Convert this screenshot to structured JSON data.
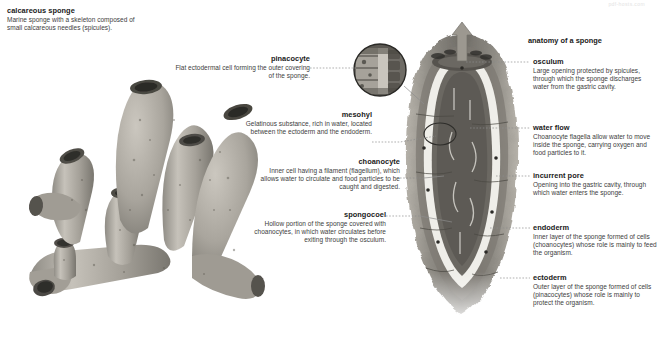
{
  "watermark": "pdf-hosts.com",
  "left_panel": {
    "title": "calcareous sponge",
    "description": "Marine sponge with a skeleton composed of small calcareous needles (spicules)."
  },
  "right_panel": {
    "section_title": "anatomy of a sponge"
  },
  "labels_left": [
    {
      "id": "pinacocyte",
      "title": "pinacocyte",
      "description": "Flat ectodermal cell forming the outer covering of the sponge."
    },
    {
      "id": "mesohyl",
      "title": "mesohyl",
      "description": "Gelatinous substance, rich in water, located between the ectoderm and the endoderm."
    },
    {
      "id": "choanocyte",
      "title": "choanocyte",
      "description": "Inner cell having a filament (flagellum), which allows water to circulate and food particles to be caught and digested."
    },
    {
      "id": "spongocoel",
      "title": "spongocoel",
      "description": "Hollow portion of the sponge covered with choanocytes, in which water circulates before exiting through the osculum."
    }
  ],
  "labels_right": [
    {
      "id": "osculum",
      "title": "osculum",
      "description": "Large opening protected by spicules, through which the sponge discharges water from the gastric cavity."
    },
    {
      "id": "water-flow",
      "title": "water flow",
      "description": "Choanocyte flagella allow water to move inside the sponge, carrying oxygen and food particles to it."
    },
    {
      "id": "incurrent-pore",
      "title": "incurrent pore",
      "description": "Opening into the gastric cavity, through which water enters the sponge."
    },
    {
      "id": "endoderm",
      "title": "endoderm",
      "description": "Inner layer of the sponge formed of cells (choanocytes) whose role is mainly to feed the organism."
    },
    {
      "id": "ectoderm",
      "title": "ectoderm",
      "description": "Outer layer of the sponge formed of cells (pinacocytes) whose role is mainly to protect the organism."
    }
  ],
  "colors": {
    "background": "#ffffff",
    "text": "#231f20",
    "description_text": "#3d3d3d",
    "leader_line": "#8d8d8d",
    "sponge_body": "#a8a49c",
    "sponge_dark": "#5e5b55",
    "cavity_dark": "#6b6862",
    "inner_lining": "#efeee9",
    "arrow": "#9c9890"
  }
}
